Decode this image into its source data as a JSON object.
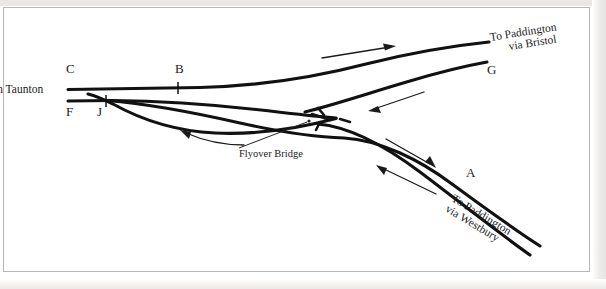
{
  "diagram": {
    "type": "railway-junction-schematic",
    "background_color": "#ffffff",
    "line_color": "#111111",
    "origin_label": "m Taunton",
    "node_labels": {
      "c": "C",
      "b": "B",
      "f": "F",
      "j": "J",
      "g": "G",
      "a": "A"
    },
    "destinations": {
      "bristol_line1": "To Paddington",
      "bristol_line2": "via Bristol",
      "westbury_line1": "To Paddington",
      "westbury_line2": "via Westbury"
    },
    "annotations": {
      "flyover": "Flyover Bridge"
    },
    "flow_arrows": [
      {
        "name": "eastbound-bristol",
        "direction": "right"
      },
      {
        "name": "westbound-from-bristol",
        "direction": "down-left"
      },
      {
        "name": "westbound-curve-to-taunton",
        "direction": "left"
      },
      {
        "name": "eastbound-to-westbury",
        "direction": "down-right"
      },
      {
        "name": "westbound-from-westbury",
        "direction": "up-left"
      }
    ]
  }
}
